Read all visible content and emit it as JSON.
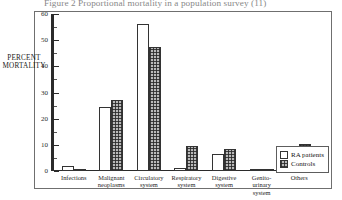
{
  "figure": {
    "title": "Figure 2 Proportional mortality in a population survey (11)"
  },
  "legend": {
    "position": "right-bottom",
    "entries": [
      {
        "label": "RA patients",
        "style": "open-white"
      },
      {
        "label": "Controls",
        "style": "hatched-grey"
      }
    ]
  },
  "axis": {
    "y_label_line1": "PERCENT",
    "y_label_line2": "MORTALITY",
    "y_ticks": [
      "0",
      "10",
      "20",
      "30",
      "40",
      "50",
      "60"
    ]
  },
  "chart_data": {
    "type": "bar",
    "title": "Figure 2 Proportional mortality in a population survey (11)",
    "xlabel": "",
    "ylabel": "PERCENT MORTALITY",
    "ylim": [
      0,
      60
    ],
    "yticks": [
      0,
      10,
      20,
      30,
      40,
      50,
      60
    ],
    "grid": false,
    "legend_position": "right-bottom",
    "categories": [
      "Infections",
      "Malignant neoplasms",
      "Circulatory system",
      "Respiratory system",
      "Digestive system",
      "Genito-urinary system",
      "Others"
    ],
    "series": [
      {
        "name": "RA patients",
        "values": [
          2.0,
          24.5,
          56.0,
          1.0,
          6.5,
          0.3,
          7.5
        ]
      },
      {
        "name": "Controls",
        "values": [
          0.3,
          27.0,
          47.5,
          9.5,
          8.5,
          0.3,
          10.5
        ]
      }
    ]
  }
}
